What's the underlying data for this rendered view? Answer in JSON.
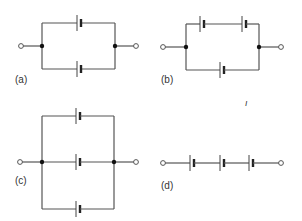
{
  "figure": {
    "panels": [
      {
        "id": "a",
        "label": "(a)",
        "description": "Two cells in parallel, one per branch"
      },
      {
        "id": "b",
        "label": "(b)",
        "description": "Two cells in series on top branch, parallel with one cell on bottom branch"
      },
      {
        "id": "c",
        "label": "(c)",
        "description": "Three cells in parallel"
      },
      {
        "id": "d",
        "label": "(d)",
        "description": "Three cells in series"
      }
    ],
    "stray_mark": "ı",
    "colors": {
      "wire": "#555555",
      "node": "#111111",
      "background": "#ffffff"
    }
  }
}
